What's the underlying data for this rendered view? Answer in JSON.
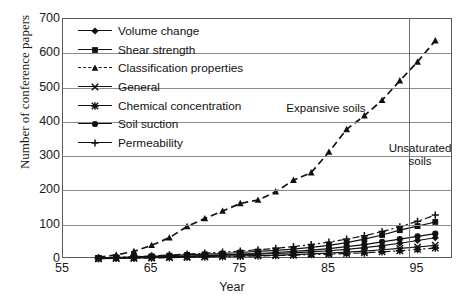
{
  "chart_data": {
    "type": "line",
    "title": "",
    "xlabel": "Year",
    "ylabel": "Number of conference papers",
    "xlim": [
      55,
      99
    ],
    "ylim": [
      0,
      700
    ],
    "xticks": [
      55,
      65,
      75,
      85,
      95
    ],
    "yticks": [
      0,
      100,
      200,
      300,
      400,
      500,
      600,
      700
    ],
    "grid": "horizontal",
    "legend_position": "upper-left-inside",
    "annotations": [
      {
        "text": "Expansive soils",
        "x": 84,
        "y": 455
      },
      {
        "text": "Unsaturated soils",
        "x": 96,
        "y": 335
      }
    ],
    "reference_lines": [
      {
        "orientation": "vertical",
        "x": 94,
        "label": ""
      }
    ],
    "series": [
      {
        "name": "Volume change",
        "marker": "diamond",
        "linestyle": "solid",
        "x": [
          59,
          61,
          63,
          65,
          67,
          69,
          71,
          73,
          75,
          77,
          79,
          81,
          83,
          85,
          87,
          89,
          91,
          93,
          95,
          97
        ],
        "values": [
          2,
          3,
          4,
          6,
          7,
          8,
          10,
          11,
          13,
          14,
          16,
          18,
          21,
          24,
          28,
          33,
          39,
          46,
          54,
          62
        ]
      },
      {
        "name": "Shear strength",
        "marker": "square",
        "linestyle": "solid",
        "x": [
          59,
          61,
          63,
          65,
          67,
          69,
          71,
          73,
          75,
          77,
          79,
          81,
          83,
          85,
          87,
          89,
          91,
          93,
          95,
          97
        ],
        "values": [
          3,
          4,
          6,
          8,
          10,
          12,
          14,
          16,
          19,
          22,
          25,
          29,
          34,
          40,
          48,
          58,
          70,
          84,
          96,
          108
        ]
      },
      {
        "name": "Classification properties",
        "marker": "triangle",
        "linestyle": "dashed",
        "x": [
          59,
          61,
          63,
          65,
          67,
          69,
          71,
          73,
          75,
          77,
          79,
          81,
          83,
          85,
          87,
          89,
          91,
          93,
          95,
          97
        ],
        "values": [
          5,
          12,
          22,
          40,
          62,
          95,
          118,
          140,
          162,
          172,
          196,
          230,
          252,
          312,
          378,
          418,
          463,
          520,
          575,
          637
        ]
      },
      {
        "name": "General",
        "marker": "x",
        "linestyle": "solid",
        "x": [
          59,
          61,
          63,
          65,
          67,
          69,
          71,
          73,
          75,
          77,
          79,
          81,
          83,
          85,
          87,
          89,
          91,
          93,
          95,
          97
        ],
        "values": [
          1,
          2,
          3,
          4,
          5,
          6,
          7,
          8,
          9,
          10,
          11,
          13,
          15,
          17,
          20,
          23,
          27,
          31,
          35,
          40
        ]
      },
      {
        "name": "Chemical concentration",
        "marker": "star",
        "linestyle": "dashdot",
        "x": [
          59,
          61,
          63,
          65,
          67,
          69,
          71,
          73,
          75,
          77,
          79,
          81,
          83,
          85,
          87,
          89,
          91,
          93,
          95,
          97
        ],
        "values": [
          1,
          2,
          2,
          3,
          4,
          5,
          6,
          7,
          8,
          9,
          10,
          11,
          13,
          14,
          16,
          18,
          21,
          24,
          28,
          32
        ]
      },
      {
        "name": "Soil suction",
        "marker": "circle",
        "linestyle": "solid",
        "x": [
          59,
          61,
          63,
          65,
          67,
          69,
          71,
          73,
          75,
          77,
          79,
          81,
          83,
          85,
          87,
          89,
          91,
          93,
          95,
          97
        ],
        "values": [
          2,
          3,
          4,
          5,
          7,
          8,
          10,
          12,
          14,
          16,
          19,
          22,
          26,
          30,
          36,
          42,
          50,
          58,
          66,
          74
        ]
      },
      {
        "name": "Permeability",
        "marker": "plus",
        "linestyle": "dashdot",
        "x": [
          59,
          61,
          63,
          65,
          67,
          69,
          71,
          73,
          75,
          77,
          79,
          81,
          83,
          85,
          87,
          89,
          91,
          93,
          95,
          97
        ],
        "values": [
          3,
          5,
          7,
          9,
          12,
          14,
          17,
          20,
          23,
          27,
          31,
          36,
          42,
          49,
          58,
          68,
          80,
          94,
          110,
          128
        ]
      }
    ]
  },
  "legend": {
    "items": [
      {
        "label": "Volume change",
        "marker": "diamond",
        "linestyle": "solid"
      },
      {
        "label": "Shear strength",
        "marker": "square",
        "linestyle": "solid"
      },
      {
        "label": "Classification properties",
        "marker": "triangle",
        "linestyle": "dashed"
      },
      {
        "label": "General",
        "marker": "x",
        "linestyle": "solid"
      },
      {
        "label": "Chemical concentration",
        "marker": "star",
        "linestyle": "solid"
      },
      {
        "label": "Soil suction",
        "marker": "circle",
        "linestyle": "solid"
      },
      {
        "label": "Permeability",
        "marker": "plus",
        "linestyle": "solid"
      }
    ]
  },
  "colors": {
    "ink": "#111111",
    "grid": "#8c8c8c",
    "frame": "#5a5a5a",
    "background": "#ffffff"
  }
}
